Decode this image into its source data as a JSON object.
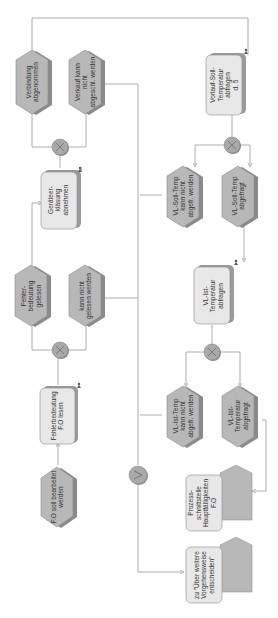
{
  "diagram": {
    "type": "EPC process chain (rotated 90°)",
    "colors": {
      "event_fill": "#b8b8b8",
      "event_shadow": "#8a8a8a",
      "function_fill": "#e8e8e8",
      "function_shadow": "#9a9a9a",
      "gateway_fill": "#a9a9a9",
      "line": "#9a9a9a"
    },
    "events": [
      {
        "id": "e1",
        "label": "Verbindung\nabgenommen"
      },
      {
        "id": "e2",
        "label": "Verkauf  kann\nnicht\nabgeschl.  werden"
      },
      {
        "id": "e3",
        "label": "Fehler-\nbedeutung\ngelesen"
      },
      {
        "id": "e4",
        "label": "kann nicht\ngelesen werden"
      },
      {
        "id": "e5",
        "label": "F.O soll bearbeitet\nwerden"
      },
      {
        "id": "e6",
        "label": "VL-Soll-Temp\nkann nicht\nabgefr.  werden"
      },
      {
        "id": "e7",
        "label": "VL-Soll-Temp\nabgefragt"
      },
      {
        "id": "e8",
        "label": "VL-Ist-Temp\nkann nicht\nabgefr.  werden"
      },
      {
        "id": "e9",
        "label": "VL-Ist-\nTemperatur\nabgefragt"
      }
    ],
    "functions": [
      {
        "id": "f1",
        "label": "Geräteer-\nkläsung\nabnehmen"
      },
      {
        "id": "f2",
        "label": "Fehlerbedeutung\nF.O lesen"
      },
      {
        "id": "f3",
        "label": "Vorlauf-Soll-\nTemperatur\nabfragen\nd. 5"
      },
      {
        "id": "f4",
        "label": "VL-Ist-\nTemperatur\nabfragen"
      }
    ],
    "process_paths": [
      {
        "id": "p1",
        "label": "Prozess-\nschnittstelle\nHauptfälligkeiten\nF.O"
      },
      {
        "id": "p2",
        "label": "zu \"Über weitere\nVorgehensweise\nentscheiden\""
      }
    ],
    "gateways": [
      {
        "id": "g1",
        "symbol": "X",
        "type": "XOR"
      },
      {
        "id": "g2",
        "symbol": "X",
        "type": "XOR"
      },
      {
        "id": "g3",
        "symbol": "X",
        "type": "XOR"
      },
      {
        "id": "g4",
        "symbol": "X",
        "type": "XOR"
      },
      {
        "id": "g5",
        "symbol": "V",
        "type": "OR"
      }
    ]
  }
}
